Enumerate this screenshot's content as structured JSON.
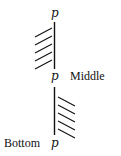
{
  "diagram": {
    "labels": {
      "top_point": "p",
      "middle_point": "p",
      "middle_text": "Middle",
      "bottom_point": "p",
      "bottom_text": "Bottom"
    },
    "walls": [
      {
        "name": "upper-wall",
        "x": 54.5,
        "y1": 22,
        "y2": 69,
        "hatch_side": "left",
        "hatch_direction": "up-right",
        "hatch_count": 5
      },
      {
        "name": "lower-wall",
        "x": 54.5,
        "y1": 87,
        "y2": 135,
        "hatch_side": "right",
        "hatch_direction": "down-right",
        "hatch_count": 5
      }
    ],
    "colors": {
      "ink": "#111111",
      "background": "#ffffff"
    }
  }
}
